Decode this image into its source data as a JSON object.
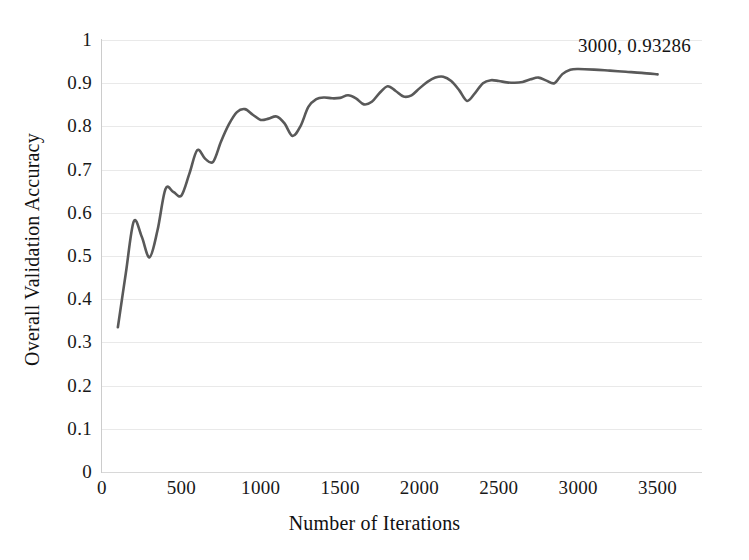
{
  "chart_data": {
    "type": "line",
    "title": "",
    "xlabel": "Number of Iterations",
    "ylabel": "Overall Validation Accuracy",
    "xlim": [
      0,
      3780
    ],
    "ylim": [
      0,
      1
    ],
    "grid": true,
    "legend": "none",
    "line_color": "#595959",
    "gridline_color": "#e9e9e9",
    "x_ticks": [
      0,
      500,
      1000,
      1500,
      2000,
      2500,
      3000,
      3500
    ],
    "x_tick_labels": [
      "0",
      "500",
      "1000",
      "1500",
      "2000",
      "2500",
      "3000",
      "3500"
    ],
    "y_ticks": [
      0,
      0.1,
      0.2,
      0.3,
      0.4,
      0.5,
      0.6,
      0.7,
      0.8,
      0.9,
      1
    ],
    "y_tick_labels": [
      "0",
      "0.1",
      "0.2",
      "0.3",
      "0.4",
      "0.5",
      "0.6",
      "0.7",
      "0.8",
      "0.9",
      "1"
    ],
    "annotations": [
      {
        "text": "3000, 0.93286",
        "x": 3000,
        "y": 0.93286
      }
    ],
    "series": [
      {
        "name": "Overall Validation Accuracy",
        "x": [
          100,
          150,
          200,
          250,
          300,
          350,
          400,
          450,
          500,
          550,
          600,
          650,
          700,
          750,
          800,
          850,
          900,
          950,
          1000,
          1050,
          1100,
          1150,
          1200,
          1250,
          1300,
          1350,
          1400,
          1450,
          1500,
          1550,
          1600,
          1650,
          1700,
          1750,
          1800,
          1850,
          1900,
          1950,
          2000,
          2050,
          2100,
          2150,
          2200,
          2250,
          2300,
          2350,
          2400,
          2450,
          2500,
          2550,
          2600,
          2650,
          2700,
          2750,
          2800,
          2850,
          2900,
          2950,
          3000,
          3100,
          3200,
          3300,
          3400,
          3500
        ],
        "values": [
          0.335,
          0.46,
          0.58,
          0.545,
          0.497,
          0.56,
          0.655,
          0.648,
          0.64,
          0.69,
          0.745,
          0.725,
          0.718,
          0.765,
          0.805,
          0.833,
          0.84,
          0.827,
          0.815,
          0.818,
          0.823,
          0.807,
          0.778,
          0.8,
          0.845,
          0.863,
          0.867,
          0.865,
          0.866,
          0.872,
          0.865,
          0.851,
          0.857,
          0.878,
          0.893,
          0.882,
          0.869,
          0.872,
          0.888,
          0.903,
          0.913,
          0.915,
          0.905,
          0.884,
          0.859,
          0.877,
          0.9,
          0.907,
          0.905,
          0.902,
          0.901,
          0.903,
          0.909,
          0.913,
          0.906,
          0.9,
          0.921,
          0.931,
          0.93286,
          0.9315,
          0.929,
          0.9265,
          0.924,
          0.9205
        ]
      }
    ]
  }
}
